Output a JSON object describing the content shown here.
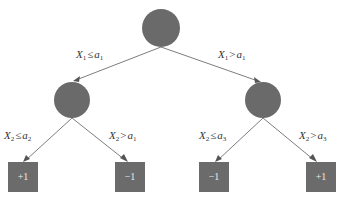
{
  "diagram": {
    "type": "decision-tree",
    "colors": {
      "node_fill": "#6a6a6a",
      "edge": "#6e6e6e",
      "leaf_text": "#eaeaea",
      "background": "#ffffff"
    },
    "root": {
      "id": "root"
    },
    "internal_nodes": [
      {
        "id": "left"
      },
      {
        "id": "right"
      }
    ],
    "edges": [
      {
        "from": "root",
        "to": "left",
        "var": "X",
        "var_sub": "1",
        "op": "≤",
        "thr": "a",
        "thr_sub": "1"
      },
      {
        "from": "root",
        "to": "right",
        "var": "X",
        "var_sub": "1",
        "op": ">",
        "thr": "a",
        "thr_sub": "1"
      },
      {
        "from": "left",
        "to": "leaf1",
        "var": "X",
        "var_sub": "2",
        "op": "≤",
        "thr": "a",
        "thr_sub": "2"
      },
      {
        "from": "left",
        "to": "leaf2",
        "var": "X",
        "var_sub": "2",
        "op": ">",
        "thr": "a",
        "thr_sub": "1"
      },
      {
        "from": "right",
        "to": "leaf3",
        "var": "X",
        "var_sub": "2",
        "op": "≤",
        "thr": "a",
        "thr_sub": "3"
      },
      {
        "from": "right",
        "to": "leaf4",
        "var": "X",
        "var_sub": "2",
        "op": ">",
        "thr": "a",
        "thr_sub": "3"
      }
    ],
    "leaves": [
      {
        "id": "leaf1",
        "label": "+1"
      },
      {
        "id": "leaf2",
        "label": "−1"
      },
      {
        "id": "leaf3",
        "label": "−1"
      },
      {
        "id": "leaf4",
        "label": "+1"
      }
    ]
  }
}
